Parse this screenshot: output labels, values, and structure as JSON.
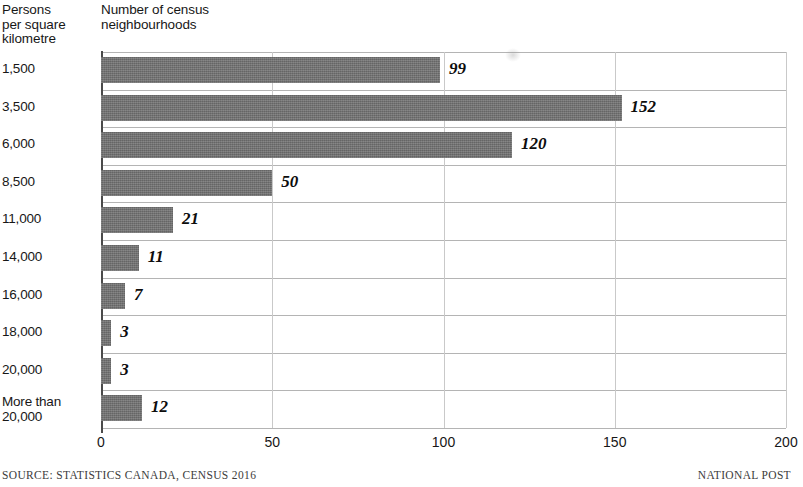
{
  "headers": {
    "y_axis_title": "Persons\nper square\nkilometre",
    "x_axis_title": "Number of census\nneighbourhoods"
  },
  "footer": {
    "source": "SOURCE: STATISTICS CANADA, CENSUS 2016",
    "credit": "NATIONAL POST"
  },
  "style": {
    "bar_color": "#6e6e6e",
    "gridline_color": "#b4b4b4",
    "axis_color": "#4a4a4a",
    "text_color": "#171717"
  },
  "chart_data": {
    "type": "bar",
    "orientation": "horizontal",
    "title": "",
    "xlabel": "Number of census neighbourhoods",
    "ylabel": "Persons per square kilometre",
    "categories": [
      "1,500",
      "3,500",
      "6,000",
      "8,500",
      "11,000",
      "14,000",
      "16,000",
      "18,000",
      "20,000",
      "More than\n20,000"
    ],
    "values": [
      99,
      152,
      120,
      50,
      21,
      11,
      7,
      3,
      3,
      12
    ],
    "value_labels": [
      "99",
      "152",
      "120",
      "50",
      "21",
      "11",
      "7",
      "3",
      "3",
      "12"
    ],
    "xlim": [
      0,
      200
    ],
    "xticks": [
      0,
      50,
      100,
      150,
      200
    ],
    "xtick_labels": [
      "0",
      "50",
      "100",
      "150",
      "200"
    ],
    "grid": true,
    "legend": false
  }
}
